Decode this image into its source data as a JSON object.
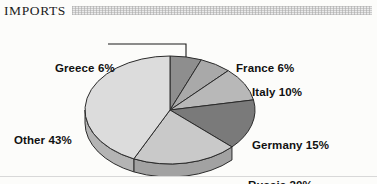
{
  "header": {
    "title": "IMPORTS",
    "rule_style": "dithered-gray-band"
  },
  "chart_data": {
    "type": "pie",
    "title": "IMPORTS",
    "subtitle": "",
    "xlabel": "",
    "ylabel": "",
    "three_d": true,
    "legend_position": "callout-labels",
    "grid": false,
    "units": "percent",
    "total": 100,
    "categories": [
      "Greece",
      "France",
      "Italy",
      "Germany",
      "Russia",
      "Other"
    ],
    "values": [
      6,
      6,
      10,
      15,
      20,
      43
    ],
    "labels": [
      "Greece 6%",
      "France 6%",
      "Italy 10%",
      "Germany 15%",
      "Russia 20%",
      "Other 43%"
    ],
    "slices": [
      {
        "name": "Greece",
        "value": 6,
        "label": "Greece 6%",
        "color": "#8e8e8e",
        "side_color": "#6f6f6f",
        "has_leader_line": true
      },
      {
        "name": "France",
        "value": 6,
        "label": "France 6%",
        "color": "#a9a9a9",
        "side_color": "#858585",
        "has_leader_line": false
      },
      {
        "name": "Italy",
        "value": 10,
        "label": "Italy 10%",
        "color": "#b8b8b8",
        "side_color": "#939393",
        "has_leader_line": false
      },
      {
        "name": "Germany",
        "value": 15,
        "label": "Germany 15%",
        "color": "#7a7a7a",
        "side_color": "#5e5e5e",
        "has_leader_line": false
      },
      {
        "name": "Russia",
        "value": 20,
        "label": "Russia 20%",
        "color": "#c9c9c9",
        "side_color": "#a2a2a2",
        "has_leader_line": false
      },
      {
        "name": "Other",
        "value": 43,
        "label": "Other 43%",
        "color": "#dcdcdc",
        "side_color": "#b4b4b4",
        "has_leader_line": false
      }
    ],
    "colors": [
      "#8e8e8e",
      "#a9a9a9",
      "#b8b8b8",
      "#7a7a7a",
      "#c9c9c9",
      "#dcdcdc"
    ],
    "outline_color": "#2b2b2b"
  }
}
